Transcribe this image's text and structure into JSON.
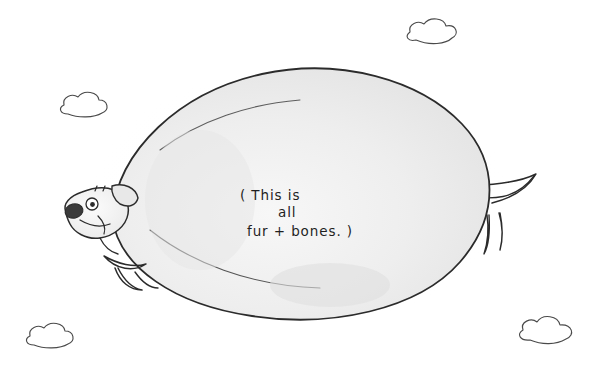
{
  "artwork": {
    "title": "Fur and bones dog cartoon",
    "medium": "pencil and ink drawing on paper",
    "background_color": "#ffffff",
    "ink_color": "#2b2b2b",
    "body_fill_color": "#f1f1f1",
    "body_shade_color": "#e2e2e2"
  },
  "caption": {
    "line1": "( This is",
    "line2": "all",
    "line3": "fur + bones. )",
    "full_text": "(This is all fur + bones.)"
  },
  "subject": {
    "name": "very round dog",
    "parts": {
      "body": "enormous oval body",
      "head": "small dog head at left",
      "nose": "dark oval nose",
      "eye": "round eye with pupil",
      "ear": "small pointed ear",
      "mouth": "curved smile",
      "front_legs": "two tiny front legs",
      "back_legs": "two tiny back legs",
      "tail": "small curved tail at right"
    }
  },
  "clouds": [
    {
      "label": "cloud-top-right",
      "x": 406,
      "y": 18
    },
    {
      "label": "cloud-upper-left",
      "x": 58,
      "y": 92
    },
    {
      "label": "cloud-bottom-left",
      "x": 20,
      "y": 322
    },
    {
      "label": "cloud-bottom-right",
      "x": 512,
      "y": 312
    }
  ]
}
